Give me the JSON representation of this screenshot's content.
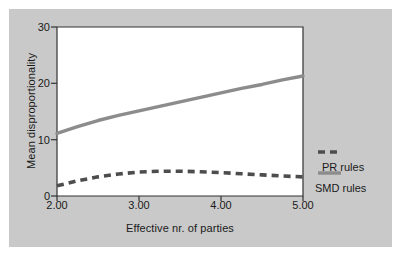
{
  "chart_data": {
    "type": "line",
    "title": "",
    "subtitle": "",
    "xlabel": "Effective nr. of parties",
    "ylabel": "Mean disproportionality",
    "xlim": [
      2.0,
      5.0
    ],
    "ylim": [
      0,
      30
    ],
    "xticks": [
      "2.00",
      "3.00",
      "4.00",
      "5.00"
    ],
    "xtick_values": [
      2.0,
      3.0,
      4.0,
      5.0
    ],
    "yticks": [
      "0",
      "10",
      "20",
      "30"
    ],
    "ytick_values": [
      0,
      10,
      20,
      30
    ],
    "grid": false,
    "legend_position": "right",
    "x": [
      2.0,
      2.25,
      2.5,
      2.75,
      3.0,
      3.25,
      3.5,
      3.75,
      4.0,
      4.25,
      4.5,
      4.75,
      5.0
    ],
    "series": [
      {
        "name": "SMD rules",
        "style": "solid",
        "color": "#8c8c8c",
        "values": [
          11.1,
          12.3,
          13.4,
          14.3,
          15.1,
          15.9,
          16.7,
          17.5,
          18.3,
          19.1,
          19.8,
          20.6,
          21.3
        ]
      },
      {
        "name": "PR rules",
        "style": "dashed",
        "color": "#4d4d4d",
        "values": [
          1.8,
          2.7,
          3.4,
          3.9,
          4.25,
          4.4,
          4.4,
          4.3,
          4.15,
          3.95,
          3.75,
          3.55,
          3.4
        ]
      }
    ]
  },
  "legend": {
    "entries": [
      {
        "label": "PR rules",
        "style": "dashed",
        "color": "#4d4d4d"
      },
      {
        "label": "SMD rules",
        "style": "solid",
        "color": "#8c8c8c"
      }
    ]
  },
  "colors": {
    "panel_background": "#c9c9c9",
    "plot_background": "#ffffff",
    "axis": "#333333",
    "text": "#1a1a1a",
    "smd_line": "#8c8c8c",
    "pr_line": "#4d4d4d"
  }
}
